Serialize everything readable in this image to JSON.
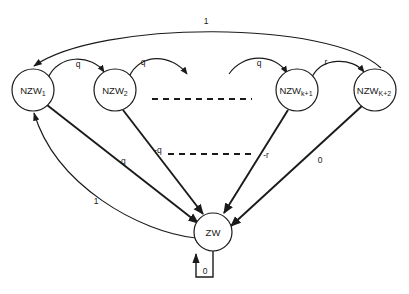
{
  "diagram": {
    "type": "state-transition-graph",
    "background_color": "#ffffff",
    "stroke_color": "#1a1a1a",
    "nodes": [
      {
        "id": "nzw1",
        "base": "NZW",
        "subscript": "1",
        "cx": 33,
        "cy": 90,
        "r": 21
      },
      {
        "id": "nzw2",
        "base": "NZW",
        "subscript": "2",
        "cx": 115,
        "cy": 90,
        "r": 21
      },
      {
        "id": "nzwk1",
        "base": "NZW",
        "subscript": "k+1",
        "cx": 297,
        "cy": 90,
        "r": 21
      },
      {
        "id": "nzwk2",
        "base": "NZW",
        "subscript": "K+2",
        "cx": 375,
        "cy": 90,
        "r": 21
      },
      {
        "id": "zw",
        "base": "ZW",
        "subscript": "",
        "cx": 213,
        "cy": 232,
        "r": 19
      }
    ],
    "edges": [
      {
        "id": "arc-k2-to-1",
        "label": "1",
        "from": "nzwk2",
        "to": "nzw1",
        "style": "long-top-arc"
      },
      {
        "id": "arc-1-to-2",
        "label": "q",
        "from": "nzw1",
        "to": "nzw2",
        "style": "short-arc"
      },
      {
        "id": "arc-2-to-dots",
        "label": "q",
        "from": "nzw2",
        "to": "ellipsis",
        "style": "short-arc"
      },
      {
        "id": "arc-dots-to-k1",
        "label": "q",
        "from": "ellipsis",
        "to": "nzwk1",
        "style": "short-arc"
      },
      {
        "id": "arc-k1-to-k2",
        "label": "r",
        "from": "nzwk1",
        "to": "nzwk2",
        "style": "short-arc"
      },
      {
        "id": "edge-1-to-zw",
        "label": "-q",
        "from": "nzw1",
        "to": "zw",
        "style": "straight-thick"
      },
      {
        "id": "edge-2-to-zw",
        "label": "-q",
        "from": "nzw2",
        "to": "zw",
        "style": "straight-thick"
      },
      {
        "id": "edge-k1-to-zw",
        "label": "-r",
        "from": "nzwk1",
        "to": "zw",
        "style": "straight-thick"
      },
      {
        "id": "edge-k2-to-zw",
        "label": "0",
        "from": "nzwk2",
        "to": "zw",
        "style": "straight-thick"
      },
      {
        "id": "edge-zw-to-1",
        "label": "1",
        "from": "zw",
        "to": "nzw1",
        "style": "curved-return"
      },
      {
        "id": "self-loop-zw",
        "label": "0",
        "from": "zw",
        "to": "zw",
        "style": "rect-self-loop"
      }
    ],
    "ellipses": [
      {
        "id": "ellipsis-upper",
        "x1": 152,
        "y1": 99,
        "x2": 252,
        "y2": 99
      },
      {
        "id": "ellipsis-lower",
        "x1": 168,
        "y1": 154,
        "x2": 252,
        "y2": 154
      }
    ]
  }
}
